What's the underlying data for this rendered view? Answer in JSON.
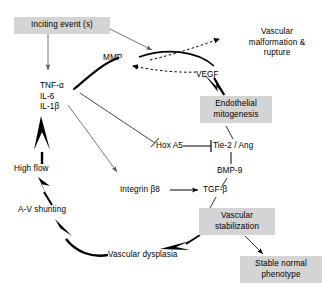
{
  "diagram": {
    "background_color": "#ffffff",
    "box_fill": "#d4d4d4",
    "line_color": "#000000",
    "dashed_line_color": "#555555",
    "nodes": {
      "inciting_event": "Inciting event (s)",
      "mmp": "MMP",
      "vegf": "VEGF",
      "vascular_malformation": "Vascular\nmalformation &\nrupture",
      "vascular_malformation_l1": "Vascular",
      "vascular_malformation_l2": "malformation &",
      "vascular_malformation_l3": "rupture",
      "cytokines_l1": "TNF-α",
      "cytokines_l2": "IL-6",
      "cytokines_l3": "IL-1β",
      "endothelial_mitogenesis_l1": "Endothelial",
      "endothelial_mitogenesis_l2": "mitogenesis",
      "hox_a5": "Hox A5",
      "tie2_ang": "Tie-2 / Ang",
      "bmp9": "BMP-9",
      "integrin_b8": "Integrin β8",
      "tgf_b": "TGF-β",
      "high_flow": "High flow",
      "av_shunting": "A-V shunting",
      "vascular_dysplasia": "Vascular dysplasia",
      "vascular_stabilization_l1": "Vascular",
      "vascular_stabilization_l2": "stabilization",
      "stable_normal_phenotype_l1": "Stable normal",
      "stable_normal_phenotype_l2": "phenotype"
    },
    "edges": [
      {
        "from": "inciting_event",
        "to": "cytokines",
        "style": "thin-arrow"
      },
      {
        "from": "inciting_event",
        "to": "mmp",
        "style": "thin-arrow"
      },
      {
        "from": "vegf",
        "to": "mmp",
        "style": "dashed-arrow"
      },
      {
        "from": "vegf",
        "to": "vascular_malformation",
        "style": "dashed-arrow-curve"
      },
      {
        "from": "vegf",
        "to": "mmp",
        "style": "solid-curve"
      },
      {
        "from": "cytokines",
        "to": "vegf",
        "style": "thick-curve-arrow"
      },
      {
        "from": "vegf",
        "to": "endothelial_mitogenesis",
        "style": "thick-arrow"
      },
      {
        "from": "cytokines",
        "to": "hox_a5",
        "style": "inhibition"
      },
      {
        "from": "cytokines",
        "to": "integrin_b8",
        "style": "thin-arrow"
      },
      {
        "from": "hox_a5",
        "to": "tie2_ang",
        "style": "inhibition"
      },
      {
        "from": "endothelial_mitogenesis",
        "to": "tie2_ang",
        "style": "line"
      },
      {
        "from": "tie2_ang",
        "to": "bmp9",
        "style": "line"
      },
      {
        "from": "bmp9",
        "to": "tgf_b",
        "style": "line"
      },
      {
        "from": "integrin_b8",
        "to": "tgf_b",
        "style": "thin-arrow"
      },
      {
        "from": "tgf_b",
        "to": "vascular_stabilization",
        "style": "line"
      },
      {
        "from": "vascular_stabilization",
        "to": "stable_normal_phenotype",
        "style": "thin-arrow"
      },
      {
        "from": "vascular_stabilization",
        "to": "vascular_dysplasia",
        "style": "thick-arrow"
      },
      {
        "from": "vascular_dysplasia",
        "to": "av_shunting",
        "style": "thick-curve-arrow"
      },
      {
        "from": "av_shunting",
        "to": "high_flow",
        "style": "thick-arrow"
      },
      {
        "from": "high_flow",
        "to": "cytokines",
        "style": "thick-arrow"
      }
    ]
  }
}
